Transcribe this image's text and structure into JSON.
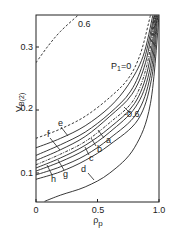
{
  "chart_data": {
    "type": "line",
    "title": "",
    "xlabel": "ρp",
    "ylabel": "V_B(2)",
    "xlim": [
      0,
      1.0
    ],
    "ylim": [
      0.055,
      0.35
    ],
    "xticks": [
      "0",
      "0.5",
      "1.0"
    ],
    "yticks": [
      "0.1",
      "0.2",
      "0.3"
    ],
    "grid": false,
    "annotations": [
      "P1=0",
      "0.6",
      "-0.6",
      "a",
      "b",
      "c",
      "d",
      "e",
      "f",
      "g",
      "h"
    ],
    "series": [
      {
        "name": "P1=0.6 (dashed)",
        "style": "dashed",
        "x": [
          0,
          0.1,
          0.2,
          0.34
        ],
        "y": [
          0.275,
          0.302,
          0.325,
          0.35
        ]
      },
      {
        "name": "P1=0 (dashed)",
        "style": "dashed",
        "x": [
          0,
          0.2,
          0.4,
          0.6,
          0.75,
          0.85,
          0.93
        ],
        "y": [
          0.155,
          0.17,
          0.19,
          0.22,
          0.25,
          0.29,
          0.35
        ]
      },
      {
        "name": "e",
        "style": "solid",
        "x": [
          0,
          0.2,
          0.4,
          0.6,
          0.75,
          0.87,
          0.95
        ],
        "y": [
          0.14,
          0.155,
          0.175,
          0.205,
          0.24,
          0.285,
          0.35
        ]
      },
      {
        "name": "f",
        "style": "solid",
        "x": [
          0,
          0.2,
          0.4,
          0.6,
          0.77,
          0.88,
          0.96
        ],
        "y": [
          0.128,
          0.145,
          0.165,
          0.195,
          0.23,
          0.28,
          0.35
        ]
      },
      {
        "name": "a",
        "style": "solid",
        "x": [
          0,
          0.2,
          0.4,
          0.6,
          0.78,
          0.89,
          0.965
        ],
        "y": [
          0.12,
          0.137,
          0.158,
          0.19,
          0.225,
          0.275,
          0.35
        ]
      },
      {
        "name": "P1=-0.6 (dash-dot)",
        "style": "dashdot",
        "x": [
          0,
          0.2,
          0.4,
          0.6,
          0.79,
          0.9,
          0.97
        ],
        "y": [
          0.113,
          0.13,
          0.15,
          0.18,
          0.215,
          0.27,
          0.35
        ]
      },
      {
        "name": "b",
        "style": "solid",
        "x": [
          0,
          0.2,
          0.4,
          0.6,
          0.8,
          0.91,
          0.975
        ],
        "y": [
          0.108,
          0.124,
          0.144,
          0.172,
          0.21,
          0.265,
          0.35
        ]
      },
      {
        "name": "g",
        "style": "solid",
        "x": [
          0,
          0.2,
          0.4,
          0.6,
          0.81,
          0.92,
          0.98
        ],
        "y": [
          0.103,
          0.118,
          0.137,
          0.165,
          0.205,
          0.26,
          0.35
        ]
      },
      {
        "name": "c",
        "style": "solid",
        "x": [
          0,
          0.2,
          0.4,
          0.6,
          0.82,
          0.93,
          0.985
        ],
        "y": [
          0.097,
          0.11,
          0.128,
          0.155,
          0.195,
          0.255,
          0.35
        ]
      },
      {
        "name": "h",
        "style": "solid",
        "x": [
          0,
          0.2,
          0.4,
          0.6,
          0.83,
          0.94,
          0.99
        ],
        "y": [
          0.09,
          0.102,
          0.12,
          0.145,
          0.185,
          0.25,
          0.35
        ]
      },
      {
        "name": "d",
        "style": "solid",
        "x": [
          0.07,
          0.2,
          0.4,
          0.6,
          0.8,
          0.93,
          1.0
        ],
        "y": [
          0.055,
          0.065,
          0.078,
          0.1,
          0.14,
          0.21,
          0.35
        ]
      }
    ]
  },
  "axes": {
    "x_label": "ρ",
    "x_label_sub": "p",
    "y_label": "V",
    "y_label_sub": "B(2)",
    "x_ticks": [
      {
        "label": "0",
        "v": 0
      },
      {
        "label": "0.5",
        "v": 0.5
      },
      {
        "label": "1.0",
        "v": 1.0
      }
    ],
    "y_ticks": [
      {
        "label": "0.1",
        "v": 0.1
      },
      {
        "label": "0.2",
        "v": 0.2
      },
      {
        "label": "0.3",
        "v": 0.3
      }
    ]
  },
  "labels": {
    "p1": "P",
    "p1_sub": "1",
    "p1_eq": "=0",
    "top_06": "0.6",
    "neg06": "-0.6",
    "a": "a",
    "b": "b",
    "c": "c",
    "d": "d",
    "e": "e",
    "f": "f",
    "g": "g",
    "h": "h"
  }
}
